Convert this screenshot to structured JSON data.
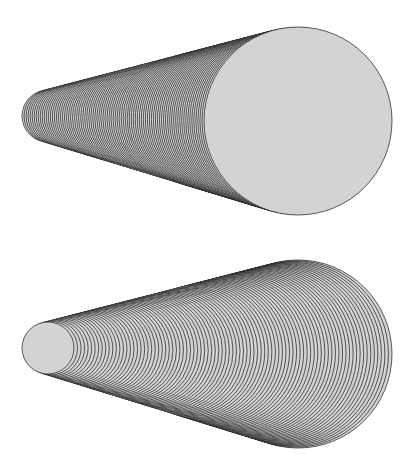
{
  "canvas": {
    "width": 412,
    "height": 465,
    "background": "#ffffff"
  },
  "style": {
    "stroke": "#1a1a1a",
    "fill": "#d3d3d3",
    "stroke_width": 0.7
  },
  "figures": [
    {
      "name": "cone-top-large-circle-front",
      "steps": 90,
      "order": "small-to-large",
      "start": {
        "cx": 48,
        "cy": 116,
        "r": 26
      },
      "end": {
        "cx": 298,
        "cy": 121,
        "r": 94
      }
    },
    {
      "name": "cone-bottom-small-circle-front",
      "steps": 90,
      "order": "large-to-small",
      "start": {
        "cx": 48,
        "cy": 348,
        "r": 26
      },
      "end": {
        "cx": 298,
        "cy": 354,
        "r": 94
      }
    }
  ]
}
